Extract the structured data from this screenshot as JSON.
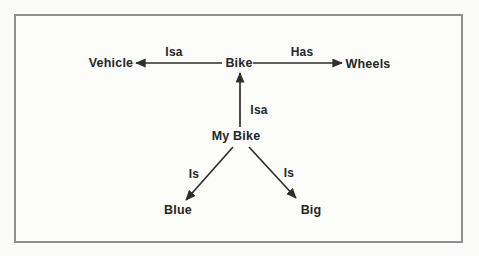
{
  "figure": {
    "type": "semantic-network-diagram",
    "background_color": "#fcfcfa",
    "frame_border_color": "#8e9092",
    "ink_color": "#2e2e2e",
    "nodes": [
      {
        "id": "vehicle",
        "label": "Vehicle",
        "pos": {
          "x": 111,
          "y": 63
        }
      },
      {
        "id": "bike",
        "label": "Bike",
        "pos": {
          "x": 239,
          "y": 63
        }
      },
      {
        "id": "wheels",
        "label": "Wheels",
        "pos": {
          "x": 368,
          "y": 64
        }
      },
      {
        "id": "my-bike",
        "label": "My Bike",
        "pos": {
          "x": 236,
          "y": 136
        }
      },
      {
        "id": "blue",
        "label": "Blue",
        "pos": {
          "x": 178,
          "y": 210
        }
      },
      {
        "id": "big",
        "label": "Big",
        "pos": {
          "x": 311,
          "y": 210
        }
      }
    ],
    "edges": [
      {
        "id": "bike-isa-vehicle",
        "label": "Isa",
        "from": "bike",
        "to": "vehicle",
        "line": {
          "x1": 222,
          "y1": 63,
          "x2": 136,
          "y2": 63
        },
        "label_pos": {
          "x": 174,
          "y": 52
        }
      },
      {
        "id": "bike-has-wheels",
        "label": "Has",
        "from": "bike",
        "to": "wheels",
        "line": {
          "x1": 253,
          "y1": 63,
          "x2": 342,
          "y2": 63
        },
        "label_pos": {
          "x": 302,
          "y": 52
        }
      },
      {
        "id": "my-bike-isa-bike",
        "label": "Isa",
        "from": "my-bike",
        "to": "bike",
        "line": {
          "x1": 240,
          "y1": 127,
          "x2": 240,
          "y2": 73
        },
        "label_pos": {
          "x": 259,
          "y": 110
        }
      },
      {
        "id": "my-bike-is-blue",
        "label": "Is",
        "from": "my-bike",
        "to": "blue",
        "line": {
          "x1": 233,
          "y1": 147,
          "x2": 186,
          "y2": 200
        },
        "label_pos": {
          "x": 194,
          "y": 174
        }
      },
      {
        "id": "my-bike-is-big",
        "label": "Is",
        "from": "my-bike",
        "to": "big",
        "line": {
          "x1": 249,
          "y1": 147,
          "x2": 296,
          "y2": 198
        },
        "label_pos": {
          "x": 289,
          "y": 173
        }
      }
    ]
  }
}
